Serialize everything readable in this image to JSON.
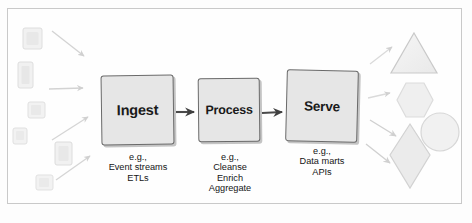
{
  "figure": {
    "kind": "pipeline-diagram",
    "style": "hand-drawn sketch",
    "frame_color": "#c9c9c9",
    "background": "#fefefe"
  },
  "stages": [
    {
      "id": "ingest",
      "label": "Ingest",
      "caption": "e.g.,\nEvent streams\nETLs",
      "fill": "#e6e6e6",
      "stroke": "#6a6a6a"
    },
    {
      "id": "process",
      "label": "Process",
      "caption": "e.g.,\nCleanse\nEnrich\nAggregate",
      "fill": "#e6e6e6",
      "stroke": "#6a6a6a"
    },
    {
      "id": "serve",
      "label": "Serve",
      "caption": "e.g.,\nData marts\nAPIs",
      "fill": "#e6e6e6",
      "stroke": "#6a6a6a"
    }
  ],
  "connectors": [
    {
      "id": "ingest-to-process",
      "from": "ingest",
      "to": "process",
      "style": "arrow"
    },
    {
      "id": "process-to-serve",
      "from": "process",
      "to": "serve",
      "style": "arrow"
    }
  ],
  "inputs": {
    "description": "faint source documents feeding the pipeline",
    "shapes": [
      {
        "name": "input-rect-1",
        "x": 23,
        "y": 28,
        "w": 19,
        "h": 21
      },
      {
        "name": "input-rect-2",
        "x": 18,
        "y": 62,
        "w": 15,
        "h": 25
      },
      {
        "name": "input-rect-3",
        "x": 28,
        "y": 102,
        "w": 17,
        "h": 15
      },
      {
        "name": "input-rect-4",
        "x": 13,
        "y": 128,
        "w": 14,
        "h": 15
      },
      {
        "name": "input-rect-5",
        "x": 55,
        "y": 142,
        "w": 17,
        "h": 22
      },
      {
        "name": "input-rect-6",
        "x": 36,
        "y": 175,
        "w": 17,
        "h": 14
      }
    ],
    "arrows": [
      {
        "name": "input-arrow-1",
        "x1": 52,
        "y1": 32,
        "x2": 84,
        "y2": 56
      },
      {
        "name": "input-arrow-2",
        "x1": 50,
        "y1": 88,
        "x2": 84,
        "y2": 88
      },
      {
        "name": "input-arrow-3",
        "x1": 54,
        "y1": 140,
        "x2": 88,
        "y2": 118
      },
      {
        "name": "input-arrow-4",
        "x1": 58,
        "y1": 178,
        "x2": 88,
        "y2": 156
      }
    ]
  },
  "outputs": {
    "description": "faint consumer shapes served by the pipeline",
    "shapes": [
      {
        "name": "output-triangle",
        "type": "triangle"
      },
      {
        "name": "output-hexagon",
        "type": "hexagon"
      },
      {
        "name": "output-circle",
        "type": "circle"
      },
      {
        "name": "output-diamond",
        "type": "diamond"
      }
    ],
    "arrows": [
      {
        "name": "output-arrow-1",
        "x1": 372,
        "y1": 62,
        "x2": 396,
        "y2": 46
      },
      {
        "name": "output-arrow-2",
        "x1": 370,
        "y1": 96,
        "x2": 392,
        "y2": 96
      },
      {
        "name": "output-arrow-3",
        "x1": 372,
        "y1": 122,
        "x2": 398,
        "y2": 138
      },
      {
        "name": "output-arrow-4",
        "x1": 368,
        "y1": 146,
        "x2": 392,
        "y2": 164
      }
    ]
  },
  "colors": {
    "box_fill": "#e6e6e6",
    "box_stroke": "#6a6a6a",
    "text": "#1a1a1a",
    "faint_shape_fill": "#f0f0f0",
    "faint_shape_stroke": "#d8d8d8",
    "connector": "#4a4a4a"
  }
}
